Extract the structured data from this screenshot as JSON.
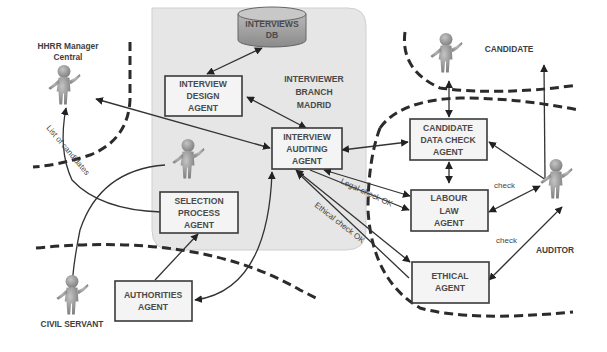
{
  "diagram": {
    "region": {
      "label_line1": "INTERVIEWER",
      "label_line2": "BRANCH",
      "label_line3": "MADRID",
      "fill": "#e6e6e6"
    },
    "database": {
      "line1": "INTERVIEWS",
      "line2": "DB",
      "fill": "#9a9a9a"
    },
    "agents": {
      "interview_design": [
        "INTERVIEW",
        "DESIGN",
        "AGENT"
      ],
      "interview_auditing": [
        "INTERVIEW",
        "AUDITING",
        "AGENT"
      ],
      "selection_process": [
        "SELECTION",
        "PROCESS",
        "AGENT"
      ],
      "authorities": [
        "AUTHORITIES",
        "AGENT"
      ],
      "candidate_data_check": [
        "CANDIDATE",
        "DATA CHECK",
        "AGENT"
      ],
      "labour_law": [
        "LABOUR",
        "LAW",
        "AGENT"
      ],
      "ethical": [
        "ETHICAL",
        "AGENT"
      ]
    },
    "actors": {
      "hhrr_manager_line1": "HHRR Manager",
      "hhrr_manager_line2": "Central",
      "candidate": "CANDIDATE",
      "auditor": "AUDITOR",
      "civil_servant": "CIVIL SERVANT"
    },
    "edge_labels": {
      "list_of_candidates": "List of candidates",
      "legal_check_ok": "Legal check OK",
      "ethical_check_ok": "Ethical check OK",
      "check_labour": "check",
      "check_ethical": "check"
    },
    "colors": {
      "actor_figure": "#8f8f8f",
      "box_stroke": "#3a3a3a",
      "dashed_boundary": "#2b2b2b"
    }
  }
}
